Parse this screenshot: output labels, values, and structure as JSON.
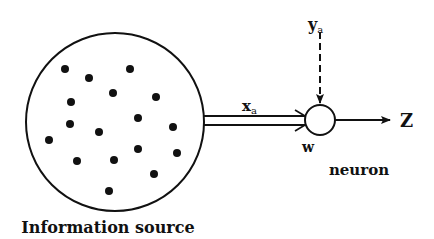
{
  "diagram": {
    "source_label": "Information source",
    "input_label": "x",
    "input_subscript": "a",
    "feedback_label": "y",
    "feedback_subscript": "a",
    "weight_label": "w",
    "output_label": "Z",
    "neuron_label": "neuron",
    "source_point_count": 17,
    "colors": {
      "ink": "#111111",
      "background": "#ffffff"
    }
  }
}
